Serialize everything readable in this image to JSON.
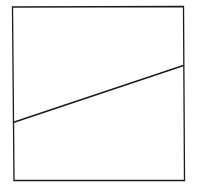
{
  "diagram": {
    "background": "#ffffff",
    "stroke_color": "#1a1a1a",
    "square": {
      "points": "12.5,7 183.5,6.5 184.5,180.5 14,180.5",
      "stroke_width": 1.3
    },
    "line": {
      "x1": 13,
      "y1": 122.5,
      "x2": 183.5,
      "y2": 65.5,
      "stroke_width": 1.6
    }
  }
}
